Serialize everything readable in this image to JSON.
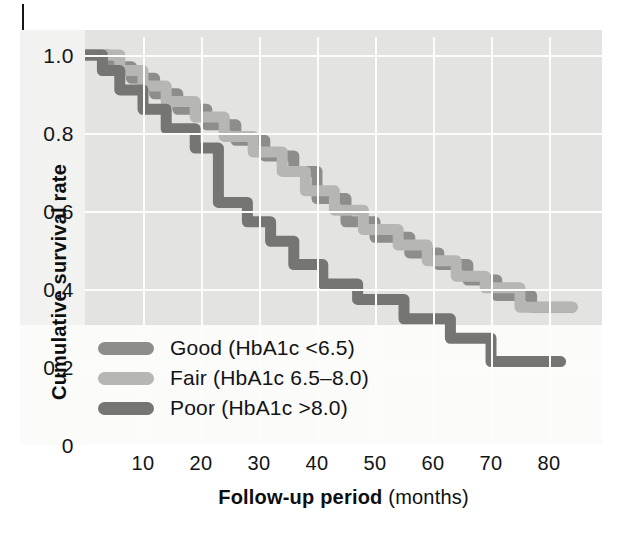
{
  "figure": {
    "background_color": "#e3e3e1",
    "gridline_color": "#fdfdfc"
  },
  "axes": {
    "y_label": "Cumulative survival rate",
    "y_ticks": [
      "1.0",
      "0.8",
      "0.6",
      "0.4",
      "0.2",
      "0"
    ],
    "x_label_bold": "Follow-up period",
    "x_label_rest": " (months)",
    "x_ticks": [
      "10",
      "20",
      "30",
      "40",
      "50",
      "60",
      "70",
      "80"
    ]
  },
  "legend": {
    "items": [
      {
        "label": "Good (HbA1c <6.5)",
        "color": "#8d8d8b"
      },
      {
        "label": "Fair (HbA1c 6.5–8.0)",
        "color": "#b6b6b3"
      },
      {
        "label": "Poor (HbA1c >8.0)",
        "color": "#757573"
      }
    ]
  },
  "chart_data": {
    "type": "line",
    "subtype": "kaplan-meier-step",
    "title": "",
    "xlabel": "Follow-up period (months)",
    "ylabel": "Cumulative survival rate",
    "xlim": [
      0,
      88
    ],
    "ylim": [
      0,
      1.0
    ],
    "x_ticks": [
      10,
      20,
      30,
      40,
      50,
      60,
      70,
      80
    ],
    "y_ticks": [
      0,
      0.2,
      0.4,
      0.6,
      0.8,
      1.0
    ],
    "grid": true,
    "legend_position": "lower-left-inside",
    "series": [
      {
        "name": "Good (HbA1c <6.5)",
        "color": "#8d8d8b",
        "points": [
          [
            0,
            1.0
          ],
          [
            4,
            1.0
          ],
          [
            4,
            0.97
          ],
          [
            8,
            0.97
          ],
          [
            8,
            0.94
          ],
          [
            12,
            0.94
          ],
          [
            12,
            0.9
          ],
          [
            16,
            0.9
          ],
          [
            16,
            0.86
          ],
          [
            21,
            0.86
          ],
          [
            21,
            0.82
          ],
          [
            26,
            0.82
          ],
          [
            26,
            0.78
          ],
          [
            31,
            0.78
          ],
          [
            31,
            0.74
          ],
          [
            36,
            0.74
          ],
          [
            36,
            0.7
          ],
          [
            40,
            0.7
          ],
          [
            40,
            0.63
          ],
          [
            45,
            0.63
          ],
          [
            45,
            0.57
          ],
          [
            50,
            0.57
          ],
          [
            50,
            0.53
          ],
          [
            56,
            0.53
          ],
          [
            56,
            0.49
          ],
          [
            61,
            0.49
          ],
          [
            61,
            0.46
          ],
          [
            66,
            0.46
          ],
          [
            66,
            0.42
          ],
          [
            71,
            0.42
          ],
          [
            71,
            0.38
          ],
          [
            77,
            0.38
          ],
          [
            77,
            0.35
          ],
          [
            84,
            0.35
          ]
        ]
      },
      {
        "name": "Fair (HbA1c 6.5–8.0)",
        "color": "#b6b6b3",
        "points": [
          [
            0,
            1.0
          ],
          [
            6,
            1.0
          ],
          [
            6,
            0.96
          ],
          [
            10,
            0.96
          ],
          [
            10,
            0.92
          ],
          [
            14,
            0.92
          ],
          [
            14,
            0.88
          ],
          [
            19,
            0.88
          ],
          [
            19,
            0.84
          ],
          [
            24,
            0.84
          ],
          [
            24,
            0.79
          ],
          [
            29,
            0.79
          ],
          [
            29,
            0.75
          ],
          [
            34,
            0.75
          ],
          [
            34,
            0.7
          ],
          [
            38,
            0.7
          ],
          [
            38,
            0.65
          ],
          [
            43,
            0.65
          ],
          [
            43,
            0.6
          ],
          [
            48,
            0.6
          ],
          [
            48,
            0.55
          ],
          [
            54,
            0.55
          ],
          [
            54,
            0.51
          ],
          [
            59,
            0.51
          ],
          [
            59,
            0.47
          ],
          [
            64,
            0.47
          ],
          [
            64,
            0.43
          ],
          [
            69,
            0.43
          ],
          [
            69,
            0.4
          ],
          [
            75,
            0.4
          ],
          [
            75,
            0.35
          ],
          [
            84,
            0.35
          ]
        ]
      },
      {
        "name": "Poor (HbA1c >8.0)",
        "color": "#757573",
        "points": [
          [
            0,
            1.0
          ],
          [
            3,
            1.0
          ],
          [
            3,
            0.96
          ],
          [
            6,
            0.96
          ],
          [
            6,
            0.91
          ],
          [
            10,
            0.91
          ],
          [
            10,
            0.86
          ],
          [
            14,
            0.86
          ],
          [
            14,
            0.81
          ],
          [
            19,
            0.81
          ],
          [
            19,
            0.76
          ],
          [
            23,
            0.76
          ],
          [
            23,
            0.62
          ],
          [
            28,
            0.62
          ],
          [
            28,
            0.57
          ],
          [
            32,
            0.57
          ],
          [
            32,
            0.52
          ],
          [
            36,
            0.52
          ],
          [
            36,
            0.46
          ],
          [
            41,
            0.46
          ],
          [
            41,
            0.41
          ],
          [
            47,
            0.41
          ],
          [
            47,
            0.37
          ],
          [
            55,
            0.37
          ],
          [
            55,
            0.32
          ],
          [
            63,
            0.32
          ],
          [
            63,
            0.27
          ],
          [
            70,
            0.27
          ],
          [
            70,
            0.21
          ],
          [
            82,
            0.21
          ]
        ]
      }
    ]
  }
}
